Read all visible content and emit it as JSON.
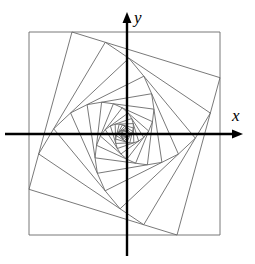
{
  "figure": {
    "background_color": "#ffffff",
    "width": 255,
    "height": 264
  },
  "axes": {
    "x_label": "x",
    "y_label": "y",
    "color": "#000000",
    "line_width": 2.4,
    "origin": {
      "x": 127,
      "y": 134
    },
    "x_axis": {
      "start_x": 5,
      "end_x": 243,
      "y": 134,
      "arrow": "right"
    },
    "y_axis": {
      "x": 127,
      "start_y": 256,
      "end_y": 12,
      "arrow": "up"
    },
    "arrow_length": 11,
    "arrow_half_width": 4.5
  },
  "chart_data": {
    "type": "line",
    "xlabel": "x",
    "ylabel": "y",
    "grid": false,
    "legend": "none",
    "outer_square": {
      "axis_aligned": true,
      "corners": [
        {
          "x": 29,
          "y": 32
        },
        {
          "x": 220,
          "y": 32
        },
        {
          "x": 220,
          "y": 235
        },
        {
          "x": 29,
          "y": 235
        }
      ]
    },
    "convergence_point": {
      "x": 128.5,
      "y": 134.5
    },
    "square_count": 19,
    "edge_division_ratio": 0.225,
    "rotation_direction": "clockwise-inward",
    "stroke_color": "#6a6a6a",
    "stroke_width": 0.9
  }
}
